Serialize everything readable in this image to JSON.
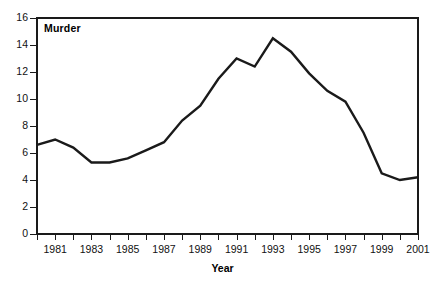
{
  "panel": {
    "title": "Murder"
  },
  "axes": {
    "x_title": "Year",
    "y_title": "",
    "y_ticks": [
      "0",
      "2",
      "4",
      "6",
      "8",
      "10",
      "12",
      "14",
      "16"
    ],
    "x_ticks_labeled": [
      "1981",
      "1983",
      "1985",
      "1987",
      "1989",
      "1991",
      "1993",
      "1995",
      "1997",
      "1999",
      "2001"
    ]
  },
  "style": {
    "line_color": "#1a1a1a",
    "axis_color": "#1a1a1a",
    "background": "#ffffff"
  },
  "chart_data": {
    "type": "line",
    "title": "Murder",
    "xlabel": "Year",
    "ylabel": "",
    "xlim": [
      1980,
      2001
    ],
    "ylim": [
      0,
      16
    ],
    "grid": false,
    "legend": "none",
    "x_tick_step": 1,
    "x_label_step": 2,
    "y_tick_step": 2,
    "x": [
      1980,
      1981,
      1982,
      1983,
      1984,
      1985,
      1986,
      1987,
      1988,
      1989,
      1990,
      1991,
      1992,
      1993,
      1994,
      1995,
      1996,
      1997,
      1998,
      1999,
      2000,
      2001
    ],
    "series": [
      {
        "name": "Murder",
        "values": [
          6.6,
          7.0,
          6.4,
          5.3,
          5.3,
          5.6,
          6.2,
          6.8,
          8.4,
          9.5,
          11.5,
          13.0,
          12.4,
          14.5,
          13.5,
          11.9,
          10.6,
          9.8,
          7.5,
          4.5,
          4.0,
          4.2
        ]
      }
    ]
  }
}
